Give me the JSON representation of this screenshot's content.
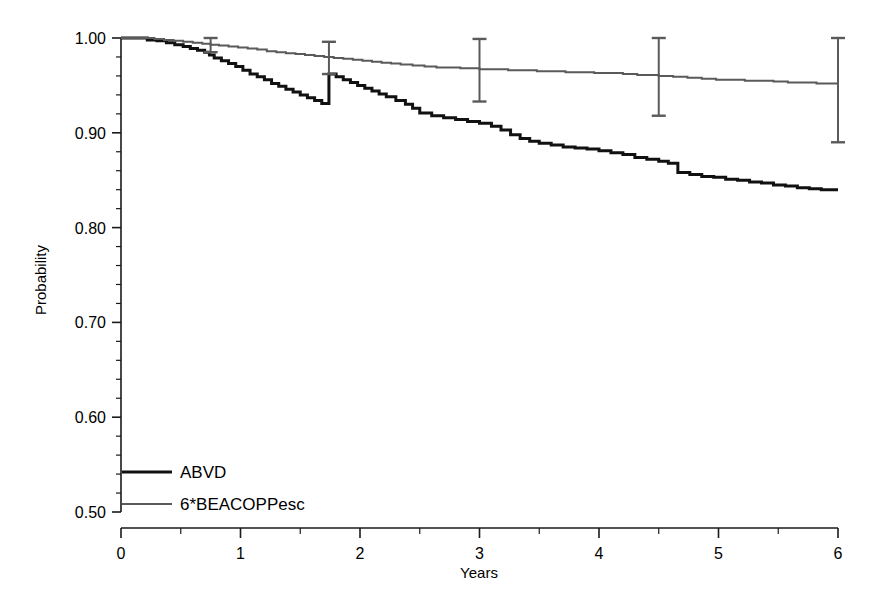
{
  "chart_data": {
    "type": "line",
    "title": "",
    "xlabel": "Years",
    "ylabel": "Probability",
    "xlim": [
      0,
      6
    ],
    "ylim": [
      0.5,
      1.0
    ],
    "grid": false,
    "legend_position": "bottom-left",
    "x_ticks": [
      "0",
      "1",
      "2",
      "3",
      "4",
      "5",
      "6"
    ],
    "x_tick_values": [
      0,
      1,
      2,
      3,
      4,
      5,
      6
    ],
    "x_minor_tick_values": [
      0.5,
      1.5,
      2.5,
      3.5,
      4.5,
      5.5
    ],
    "y_ticks": [
      "0.50",
      "0.60",
      "0.70",
      "0.80",
      "0.90",
      "1.00"
    ],
    "y_tick_values": [
      0.5,
      0.6,
      0.7,
      0.8,
      0.9,
      1.0
    ],
    "y_minor_tick_values": [
      0.52,
      0.54,
      0.56,
      0.58,
      0.62,
      0.64,
      0.66,
      0.68,
      0.72,
      0.74,
      0.76,
      0.78,
      0.82,
      0.84,
      0.86,
      0.88,
      0.92,
      0.94,
      0.96,
      0.98
    ],
    "series": [
      {
        "name": "ABVD",
        "color": "#111111",
        "line_width": 3.0,
        "step": true,
        "points": [
          [
            0.0,
            1.0
          ],
          [
            0.18,
            1.0
          ],
          [
            0.22,
            0.998
          ],
          [
            0.3,
            0.997
          ],
          [
            0.38,
            0.995
          ],
          [
            0.45,
            0.993
          ],
          [
            0.52,
            0.991
          ],
          [
            0.58,
            0.989
          ],
          [
            0.64,
            0.987
          ],
          [
            0.7,
            0.985
          ],
          [
            0.74,
            0.982
          ],
          [
            0.78,
            0.979
          ],
          [
            0.84,
            0.976
          ],
          [
            0.9,
            0.973
          ],
          [
            0.96,
            0.97
          ],
          [
            1.02,
            0.966
          ],
          [
            1.08,
            0.962
          ],
          [
            1.14,
            0.959
          ],
          [
            1.2,
            0.956
          ],
          [
            1.26,
            0.952
          ],
          [
            1.32,
            0.949
          ],
          [
            1.38,
            0.946
          ],
          [
            1.44,
            0.943
          ],
          [
            1.5,
            0.94
          ],
          [
            1.56,
            0.937
          ],
          [
            1.62,
            0.934
          ],
          [
            1.68,
            0.931
          ],
          [
            1.74,
            0.962
          ],
          [
            1.8,
            0.959
          ],
          [
            1.86,
            0.956
          ],
          [
            1.92,
            0.953
          ],
          [
            1.98,
            0.95
          ],
          [
            2.04,
            0.947
          ],
          [
            2.1,
            0.944
          ],
          [
            2.16,
            0.941
          ],
          [
            2.22,
            0.938
          ],
          [
            2.3,
            0.934
          ],
          [
            2.38,
            0.93
          ],
          [
            2.44,
            0.926
          ],
          [
            2.5,
            0.921
          ],
          [
            2.6,
            0.918
          ],
          [
            2.7,
            0.916
          ],
          [
            2.8,
            0.914
          ],
          [
            2.9,
            0.912
          ],
          [
            3.0,
            0.91
          ],
          [
            3.1,
            0.907
          ],
          [
            3.18,
            0.903
          ],
          [
            3.26,
            0.898
          ],
          [
            3.34,
            0.894
          ],
          [
            3.42,
            0.891
          ],
          [
            3.5,
            0.889
          ],
          [
            3.6,
            0.887
          ],
          [
            3.7,
            0.885
          ],
          [
            3.8,
            0.884
          ],
          [
            3.9,
            0.883
          ],
          [
            4.0,
            0.881
          ],
          [
            4.1,
            0.879
          ],
          [
            4.2,
            0.877
          ],
          [
            4.3,
            0.874
          ],
          [
            4.4,
            0.872
          ],
          [
            4.5,
            0.87
          ],
          [
            4.58,
            0.868
          ],
          [
            4.66,
            0.858
          ],
          [
            4.76,
            0.856
          ],
          [
            4.86,
            0.854
          ],
          [
            4.96,
            0.853
          ],
          [
            5.06,
            0.851
          ],
          [
            5.16,
            0.85
          ],
          [
            5.26,
            0.848
          ],
          [
            5.36,
            0.847
          ],
          [
            5.46,
            0.845
          ],
          [
            5.56,
            0.844
          ],
          [
            5.66,
            0.842
          ],
          [
            5.76,
            0.841
          ],
          [
            5.86,
            0.84
          ],
          [
            6.0,
            0.84
          ]
        ],
        "final_value": 0.84
      },
      {
        "name": "6*BEACOPPesc",
        "color": "#5a5a5a",
        "line_width": 2.0,
        "step": true,
        "points": [
          [
            0.0,
            1.0
          ],
          [
            0.2,
            1.0
          ],
          [
            0.28,
            0.999
          ],
          [
            0.36,
            0.998
          ],
          [
            0.44,
            0.997
          ],
          [
            0.52,
            0.996
          ],
          [
            0.6,
            0.995
          ],
          [
            0.68,
            0.994
          ],
          [
            0.75,
            0.993
          ],
          [
            0.82,
            0.992
          ],
          [
            0.9,
            0.991
          ],
          [
            0.98,
            0.99
          ],
          [
            1.06,
            0.989
          ],
          [
            1.14,
            0.988
          ],
          [
            1.22,
            0.986
          ],
          [
            1.3,
            0.985
          ],
          [
            1.38,
            0.984
          ],
          [
            1.46,
            0.983
          ],
          [
            1.54,
            0.982
          ],
          [
            1.62,
            0.981
          ],
          [
            1.7,
            0.98
          ],
          [
            1.78,
            0.979
          ],
          [
            1.86,
            0.978
          ],
          [
            1.94,
            0.977
          ],
          [
            2.02,
            0.976
          ],
          [
            2.1,
            0.975
          ],
          [
            2.18,
            0.974
          ],
          [
            2.26,
            0.973
          ],
          [
            2.34,
            0.972
          ],
          [
            2.44,
            0.971
          ],
          [
            2.54,
            0.97
          ],
          [
            2.64,
            0.969
          ],
          [
            2.74,
            0.969
          ],
          [
            2.84,
            0.968
          ],
          [
            2.94,
            0.968
          ],
          [
            3.0,
            0.967
          ],
          [
            3.12,
            0.967
          ],
          [
            3.24,
            0.966
          ],
          [
            3.36,
            0.966
          ],
          [
            3.48,
            0.965
          ],
          [
            3.6,
            0.965
          ],
          [
            3.72,
            0.964
          ],
          [
            3.84,
            0.964
          ],
          [
            3.96,
            0.963
          ],
          [
            4.08,
            0.963
          ],
          [
            4.2,
            0.962
          ],
          [
            4.32,
            0.961
          ],
          [
            4.44,
            0.961
          ],
          [
            4.5,
            0.96
          ],
          [
            4.62,
            0.959
          ],
          [
            4.74,
            0.958
          ],
          [
            4.86,
            0.957
          ],
          [
            4.98,
            0.956
          ],
          [
            5.1,
            0.956
          ],
          [
            5.22,
            0.955
          ],
          [
            5.34,
            0.955
          ],
          [
            5.46,
            0.954
          ],
          [
            5.58,
            0.953
          ],
          [
            5.7,
            0.953
          ],
          [
            5.82,
            0.952
          ],
          [
            6.0,
            0.952
          ]
        ],
        "final_value": 0.952
      }
    ],
    "error_bars": [
      {
        "series": "6*BEACOPPesc",
        "x": 0.75,
        "y": 0.993,
        "low": 0.985,
        "high": 1.0
      },
      {
        "series": "6*BEACOPPesc",
        "x": 1.74,
        "y": 0.979,
        "low": 0.962,
        "high": 0.996
      },
      {
        "series": "6*BEACOPPesc",
        "x": 3.0,
        "y": 0.967,
        "low": 0.933,
        "high": 0.999
      },
      {
        "series": "6*BEACOPPesc",
        "x": 4.5,
        "y": 0.96,
        "low": 0.918,
        "high": 1.0
      },
      {
        "series": "6*BEACOPPesc",
        "x": 6.0,
        "y": 0.952,
        "low": 0.89,
        "high": 1.0
      }
    ]
  },
  "axes": {
    "y_title": "Probability",
    "x_title": "Years"
  },
  "legend": {
    "entries": [
      {
        "label": "ABVD"
      },
      {
        "label": "6*BEACOPPesc"
      }
    ]
  }
}
